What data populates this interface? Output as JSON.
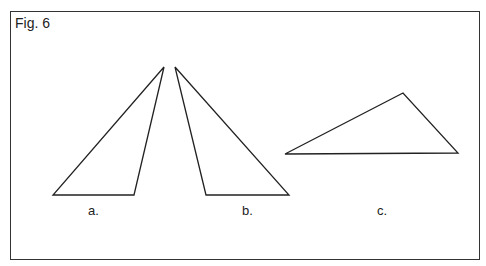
{
  "figure": {
    "title": "Fig. 6",
    "stroke_color": "#222222",
    "triangles": [
      {
        "id": "a",
        "label": "a.",
        "points": [
          [
            164,
            67
          ],
          [
            53,
            195
          ],
          [
            134,
            195
          ]
        ],
        "label_pos": [
          88,
          203
        ]
      },
      {
        "id": "b",
        "label": "b.",
        "points": [
          [
            175,
            67
          ],
          [
            206,
            195
          ],
          [
            289,
            195
          ]
        ],
        "label_pos": [
          242,
          203
        ]
      },
      {
        "id": "c",
        "label": "c.",
        "points": [
          [
            285,
            154
          ],
          [
            403,
            93
          ],
          [
            458,
            153
          ]
        ],
        "label_pos": [
          377,
          203
        ]
      }
    ]
  }
}
